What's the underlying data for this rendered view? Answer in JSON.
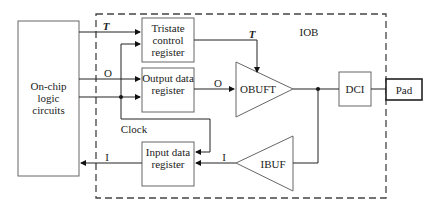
{
  "diagram": {
    "iob_label": "IOB",
    "blocks": {
      "logic": "On-chip logic circuits",
      "tristate": "Tristate control register",
      "output_reg": "Output data register",
      "input_reg": "Input data register",
      "obuft": "OBUFT",
      "ibuf": "IBUF",
      "dci": "DCI",
      "pad": "Pad"
    },
    "signals": {
      "t_in": "T",
      "t_out": "T",
      "o_in": "O",
      "o_out": "O",
      "clock": "Clock",
      "i_in": "I",
      "i_out": "I"
    }
  }
}
